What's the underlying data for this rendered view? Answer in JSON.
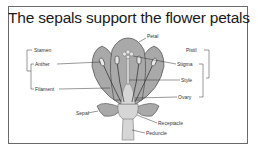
{
  "title": "The sepals support the flower petals",
  "diagram": {
    "labels_left": {
      "stamen": "Stamen",
      "anther": "Anther",
      "filament": "Filament",
      "sepal": "Sepal"
    },
    "labels_right": {
      "pistil": "Pistil",
      "stigma": "Stigma",
      "style": "Style",
      "ovary": "Ovary",
      "receptacle": "Receptacle",
      "peduncle": "Peduncle"
    },
    "labels_top": {
      "petal": "Petal"
    },
    "colors": {
      "petal_fill": "#a9a9a9",
      "petal_stroke": "#4a4a4a",
      "stem_fill": "#d6d6d6",
      "frame": "#6a6a6a"
    }
  }
}
